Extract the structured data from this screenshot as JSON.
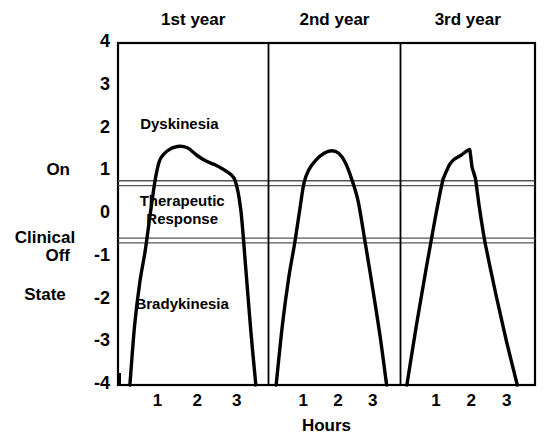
{
  "chart_data": {
    "type": "line",
    "title": "",
    "subtitle": "",
    "xlabel": "Hours",
    "ylabel": "Clinical State",
    "ylim": [
      -4,
      4
    ],
    "yticks": [
      4,
      3,
      2,
      1,
      0,
      -1,
      -2,
      -3,
      -4
    ],
    "ytick_labels": [
      "4",
      "3",
      "2",
      "1",
      "0",
      "-1",
      "-2",
      "-3",
      "-4"
    ],
    "y_named_ticks": [
      {
        "label": "On",
        "value": 1
      },
      {
        "label": "Off",
        "value": -1
      }
    ],
    "grid": false,
    "legend": "none",
    "panels": [
      {
        "name": "1st year",
        "xlim": [
          0,
          3.8
        ],
        "xticks": [
          1,
          2,
          3
        ],
        "xtick_labels": [
          "1",
          "2",
          "3"
        ],
        "series": [
          {
            "name": "Clinical state response",
            "points": [
              [
                0.3,
                -4.0
              ],
              [
                0.42,
                -2.6
              ],
              [
                0.55,
                -1.6
              ],
              [
                0.68,
                -0.9
              ],
              [
                0.8,
                -0.1
              ],
              [
                0.93,
                0.75
              ],
              [
                1.05,
                1.25
              ],
              [
                1.25,
                1.48
              ],
              [
                1.5,
                1.58
              ],
              [
                1.75,
                1.55
              ],
              [
                1.98,
                1.38
              ],
              [
                2.2,
                1.25
              ],
              [
                2.45,
                1.15
              ],
              [
                2.7,
                1.02
              ],
              [
                2.95,
                0.8
              ],
              [
                3.1,
                0.1
              ],
              [
                3.22,
                -1.2
              ],
              [
                3.35,
                -2.7
              ],
              [
                3.48,
                -4.0
              ]
            ]
          }
        ]
      },
      {
        "name": "2nd year",
        "xlim": [
          0,
          3.8
        ],
        "xticks": [
          1,
          2,
          3
        ],
        "xtick_labels": [
          "1",
          "2",
          "3"
        ],
        "series": [
          {
            "name": "Clinical state response",
            "points": [
              [
                0.22,
                -4.0
              ],
              [
                0.4,
                -2.6
              ],
              [
                0.58,
                -1.5
              ],
              [
                0.75,
                -0.7
              ],
              [
                0.9,
                0.1
              ],
              [
                1.02,
                0.72
              ],
              [
                1.15,
                1.02
              ],
              [
                1.35,
                1.25
              ],
              [
                1.6,
                1.42
              ],
              [
                1.82,
                1.48
              ],
              [
                2.02,
                1.42
              ],
              [
                2.2,
                1.22
              ],
              [
                2.38,
                0.85
              ],
              [
                2.58,
                0.3
              ],
              [
                2.8,
                -0.75
              ],
              [
                3.02,
                -1.85
              ],
              [
                3.22,
                -2.9
              ],
              [
                3.4,
                -4.0
              ]
            ]
          }
        ]
      },
      {
        "name": "3rd year",
        "xlim": [
          0,
          3.8
        ],
        "xticks": [
          1,
          2,
          3
        ],
        "xtick_labels": [
          "1",
          "2",
          "3"
        ],
        "series": [
          {
            "name": "Clinical state response",
            "points": [
              [
                0.18,
                -4.0
              ],
              [
                0.45,
                -2.6
              ],
              [
                0.72,
                -1.3
              ],
              [
                0.98,
                -0.1
              ],
              [
                1.2,
                0.8
              ],
              [
                1.38,
                1.15
              ],
              [
                1.52,
                1.28
              ],
              [
                1.72,
                1.38
              ],
              [
                1.88,
                1.48
              ],
              [
                1.96,
                1.5
              ],
              [
                2.02,
                1.1
              ],
              [
                2.12,
                0.82
              ],
              [
                2.22,
                0.2
              ],
              [
                2.4,
                -0.72
              ],
              [
                2.7,
                -1.9
              ],
              [
                3.0,
                -3.0
              ],
              [
                3.3,
                -4.0
              ]
            ]
          }
        ]
      }
    ],
    "bands": [
      {
        "name": "on-threshold",
        "value": 0.72,
        "style": "double-line"
      },
      {
        "name": "off-threshold",
        "value": -0.62,
        "style": "double-line"
      }
    ],
    "region_labels": [
      {
        "text": "Dyskinesia",
        "panel": 0,
        "x": 1.55,
        "y": 2.05
      },
      {
        "text": "Therapeutic\nResponse",
        "panel": 0,
        "x": 1.62,
        "y": 0.05
      },
      {
        "text": "Bradykinesia",
        "panel": 0,
        "x": 1.62,
        "y": -2.15
      }
    ]
  },
  "axes": {
    "y_title": "Clinical\nState",
    "y_title_line1": "Clinical",
    "y_title_line2": "State",
    "x_title": "Hours",
    "on_label": "On",
    "off_label": "Off"
  },
  "colors": {
    "line": "#000000",
    "axis": "#000000",
    "background": "#ffffff",
    "band": "#555555"
  }
}
